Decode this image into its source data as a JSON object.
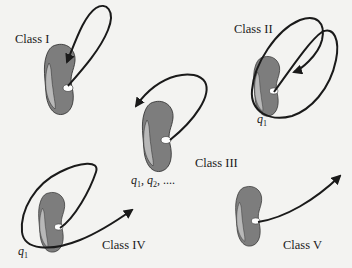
{
  "figure": {
    "background": "#f3f3f1",
    "cell_color": "#7d7d7d",
    "cell_edge_color": "#b8b8b8",
    "nucleus_color": "#ffffff",
    "line_color": "#1a1a1a",
    "classes": [
      {
        "id": "I",
        "label": "Class I"
      },
      {
        "id": "II",
        "label": "Class II",
        "annotation": {
          "sym": "q",
          "sub": "1"
        }
      },
      {
        "id": "III",
        "label": "Class III",
        "annotation_text": "q1, q2, ....",
        "annotation_parts": [
          {
            "sym": "q",
            "sub": "1"
          },
          {
            "sym": "q",
            "sub": "2"
          }
        ],
        "annotation_tail": ", ...."
      },
      {
        "id": "IV",
        "label": "Class IV",
        "annotation": {
          "sym": "q",
          "sub": "1"
        }
      },
      {
        "id": "V",
        "label": "Class V"
      }
    ]
  }
}
